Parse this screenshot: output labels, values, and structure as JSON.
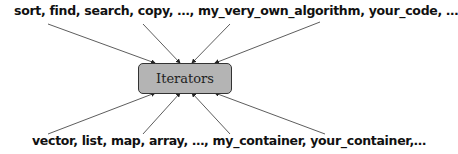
{
  "diagram": {
    "top_label": "sort, find, search, copy, …, my_very_own_algorithm, your_code, …",
    "bottom_label": "vector, list, map, array, …, my_container, your_container,…",
    "center_box": "Iterators",
    "colors": {
      "box_fill": "#b4b4b4",
      "box_border": "#333333",
      "arrow": "#333333",
      "text": "#111111"
    },
    "arrows": [
      {
        "from": "algorithms",
        "x1": 48,
        "y1": 24,
        "x2": 155,
        "y2": 63
      },
      {
        "from": "algorithms",
        "x1": 143,
        "y1": 24,
        "x2": 180,
        "y2": 63
      },
      {
        "from": "algorithms",
        "x1": 230,
        "y1": 24,
        "x2": 192,
        "y2": 63
      },
      {
        "from": "algorithms",
        "x1": 320,
        "y1": 22,
        "x2": 215,
        "y2": 63
      },
      {
        "from": "containers",
        "x1": 48,
        "y1": 134,
        "x2": 155,
        "y2": 93
      },
      {
        "from": "containers",
        "x1": 143,
        "y1": 134,
        "x2": 180,
        "y2": 93
      },
      {
        "from": "containers",
        "x1": 230,
        "y1": 134,
        "x2": 192,
        "y2": 93
      },
      {
        "from": "containers",
        "x1": 325,
        "y1": 134,
        "x2": 215,
        "y2": 93
      }
    ]
  }
}
